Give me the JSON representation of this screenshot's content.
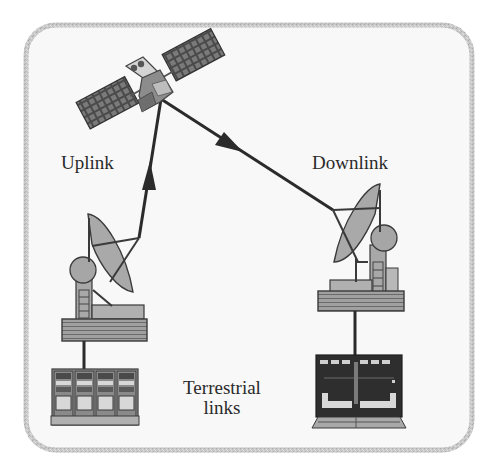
{
  "diagram": {
    "labels": {
      "uplink": "Uplink",
      "downlink": "Downlink",
      "terrestrial_line1": "Terrestrial",
      "terrestrial_line2": "links"
    },
    "nodes": [
      {
        "id": "satellite",
        "kind": "satellite",
        "icon": "satellite-icon"
      },
      {
        "id": "uplink-earth-station",
        "kind": "dish-antenna",
        "icon": "dish-antenna-icon"
      },
      {
        "id": "downlink-earth-station",
        "kind": "dish-antenna",
        "icon": "dish-antenna-icon"
      },
      {
        "id": "uplink-terminal",
        "kind": "equipment-racks",
        "icon": "server-rack-icon"
      },
      {
        "id": "downlink-terminal",
        "kind": "terminal-equipment",
        "icon": "terminal-equipment-icon"
      }
    ],
    "edges": [
      {
        "from": "uplink-earth-station",
        "to": "satellite",
        "label": "Uplink",
        "directed": true
      },
      {
        "from": "satellite",
        "to": "downlink-earth-station",
        "label": "Downlink",
        "directed": true
      },
      {
        "from": "uplink-terminal",
        "to": "uplink-earth-station",
        "label": "Terrestrial links",
        "directed": false
      },
      {
        "from": "downlink-terminal",
        "to": "downlink-earth-station",
        "label": "Terrestrial links",
        "directed": false
      }
    ],
    "colors": {
      "frame_border": "#bdbdbd",
      "frame_fill": "#f7f7f7",
      "line": "#2b2b2b",
      "panel_dark": "#5a5a5a",
      "body_gray": "#9a9a9a",
      "light_gray": "#c4c4c4",
      "text": "#2a2a2a"
    }
  }
}
